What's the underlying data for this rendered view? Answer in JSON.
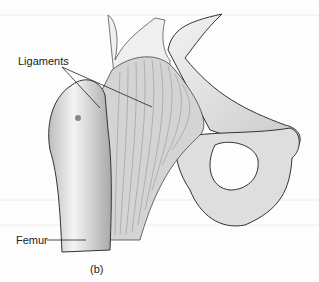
{
  "figure": {
    "panel_label": "(b)",
    "labels": [
      {
        "id": "ligaments",
        "text": "Ligaments"
      },
      {
        "id": "femur",
        "text": "Femur"
      }
    ]
  }
}
